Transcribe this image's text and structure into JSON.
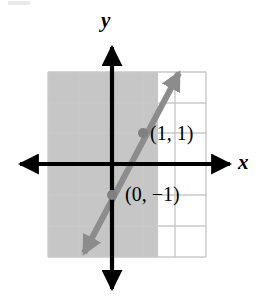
{
  "figure": {
    "kind": "coordinate-plane-graph",
    "width": 271,
    "height": 300,
    "background_color": "#ffffff"
  },
  "axes": {
    "x_label": "x",
    "y_label": "y",
    "axis_color": "#000000",
    "x_axis": {
      "start_px": 18,
      "end_px": 232,
      "y_px": 164
    },
    "y_axis": {
      "start_px": 45,
      "end_px": 291,
      "x_px": 112
    },
    "arrowheads": [
      "left",
      "right",
      "up",
      "down"
    ]
  },
  "grid": {
    "line_color": "#c9c9c9",
    "cell_size_px": 31,
    "left_px": 48,
    "top_px": 72,
    "right_px": 206,
    "bottom_px": 257,
    "columns": 5,
    "rows": 6
  },
  "shaded_region": {
    "fill_color": "#c6c6c6",
    "description": "region to the left of the line",
    "left_px": 48,
    "top_px": 72,
    "right_px": 158,
    "bottom_px": 257
  },
  "line": {
    "color": "#8c8c8c",
    "stroke_width": 6,
    "slope": 2,
    "y_intercept": -1,
    "style": "solid",
    "arrow_start_px": [
      82,
      256
    ],
    "arrow_end_px": [
      181,
      70
    ]
  },
  "points": [
    {
      "name": "point-1-1",
      "label": "(1, 1)",
      "coords": [
        1,
        1
      ],
      "px": [
        143,
        133
      ],
      "dot_color": "#808080"
    },
    {
      "name": "point-0-neg1",
      "label": "(0, −1)",
      "coords": [
        0,
        -1
      ],
      "px": [
        112,
        195
      ],
      "dot_color": "#808080"
    }
  ],
  "colors": {
    "shade": "#c6c6c6",
    "grid": "#c9c9c9",
    "line": "#8c8c8c",
    "axis": "#000000",
    "text": "#000000"
  }
}
